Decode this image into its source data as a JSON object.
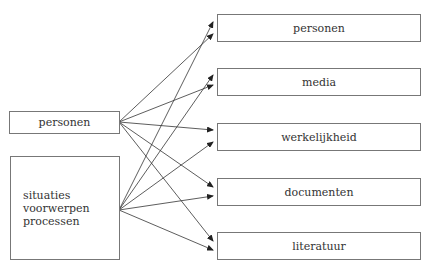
{
  "sources": [
    {
      "id": "src-personen",
      "lines": [
        "personen"
      ],
      "x": 9,
      "y": 111,
      "w": 111,
      "h": 23,
      "anchor": [
        119,
        122
      ]
    },
    {
      "id": "src-situaties",
      "lines": [
        "situaties",
        "voorwerpen",
        "processen"
      ],
      "x": 10,
      "y": 156,
      "w": 110,
      "h": 104,
      "anchor": [
        119,
        210
      ]
    }
  ],
  "targets": [
    {
      "id": "tgt-personen",
      "label": "personen",
      "x": 217,
      "y": 14,
      "w": 204,
      "h": 28,
      "tips": [
        [
          213,
          22
        ],
        [
          213,
          34
        ]
      ]
    },
    {
      "id": "tgt-media",
      "label": "media",
      "x": 217,
      "y": 68,
      "w": 204,
      "h": 28,
      "tips": [
        [
          213,
          75
        ],
        [
          213,
          85
        ]
      ]
    },
    {
      "id": "tgt-werkelijkheid",
      "label": "werkelijkheid",
      "x": 217,
      "y": 123,
      "w": 204,
      "h": 28,
      "tips": [
        [
          213,
          130
        ],
        [
          213,
          142
        ]
      ]
    },
    {
      "id": "tgt-documenten",
      "label": "documenten",
      "x": 217,
      "y": 178,
      "w": 204,
      "h": 28,
      "tips": [
        [
          213,
          187
        ],
        [
          213,
          196
        ]
      ]
    },
    {
      "id": "tgt-literatuur",
      "label": "literatuur",
      "x": 217,
      "y": 232,
      "w": 204,
      "h": 28,
      "tips": [
        [
          213,
          241
        ],
        [
          213,
          250
        ]
      ]
    }
  ],
  "edges": [
    {
      "from": "src-personen",
      "to": "tgt-personen",
      "tip": 1
    },
    {
      "from": "src-situaties",
      "to": "tgt-personen",
      "tip": 0
    },
    {
      "from": "src-personen",
      "to": "tgt-media",
      "tip": 1
    },
    {
      "from": "src-situaties",
      "to": "tgt-media",
      "tip": 0
    },
    {
      "from": "src-personen",
      "to": "tgt-werkelijkheid",
      "tip": 0
    },
    {
      "from": "src-situaties",
      "to": "tgt-werkelijkheid",
      "tip": 1
    },
    {
      "from": "src-personen",
      "to": "tgt-documenten",
      "tip": 0
    },
    {
      "from": "src-situaties",
      "to": "tgt-documenten",
      "tip": 1
    },
    {
      "from": "src-personen",
      "to": "tgt-literatuur",
      "tip": 0
    },
    {
      "from": "src-situaties",
      "to": "tgt-literatuur",
      "tip": 1
    }
  ],
  "colors": {
    "line": "#333333",
    "border": "#777777",
    "text": "#333333"
  }
}
